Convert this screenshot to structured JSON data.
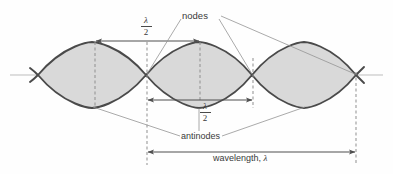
{
  "diagram": {
    "labels": {
      "nodes": "nodes",
      "antinodes": "antinodes",
      "wavelength": "wavelength,",
      "lambda_symbol": "λ",
      "half_wavelength_numerator": "λ",
      "half_wavelength_denominator": "2"
    },
    "colors": {
      "background": "#fefefe",
      "wave_stroke": "#4a4a4a",
      "wave_fill": "#d8d8d8",
      "axis": "#b9b9b9",
      "dashed": "#8a8a8a",
      "arrow": "#4f4f4f",
      "leader": "#8f8f8f",
      "text": "#3a3a3a"
    },
    "geometry": {
      "axis_y": 75,
      "amplitude": 33,
      "node_positions_x": [
        38,
        146,
        252,
        356
      ],
      "antinode_positions_x": [
        92,
        199,
        304
      ],
      "lobe_count": 3
    },
    "measurements": [
      {
        "name": "half-wavelength-top",
        "label": "λ/2",
        "from_x": 95,
        "to_x": 200,
        "y": 41,
        "spans": "antinode-1 to antinode-2"
      },
      {
        "name": "half-wavelength-middle",
        "label": "λ/2",
        "from_x": 147,
        "to_x": 253,
        "y": 100,
        "spans": "node-2 to node-3"
      },
      {
        "name": "full-wavelength",
        "label": "wavelength, λ",
        "from_x": 147,
        "to_x": 356,
        "y": 152,
        "spans": "node-2 to node-4"
      }
    ],
    "dashed_guides": [
      {
        "name": "antinode-1-guide",
        "x": 95,
        "y1": 42,
        "y2": 108
      },
      {
        "name": "node-2-guide",
        "x": 147,
        "y1": 42,
        "y2": 165
      },
      {
        "name": "antinode-2-guide",
        "x": 200,
        "y1": 42,
        "y2": 100
      },
      {
        "name": "node-3-guide",
        "x": 253,
        "y1": 60,
        "y2": 108
      },
      {
        "name": "node-4-guide",
        "x": 356,
        "y1": 72,
        "y2": 165
      }
    ],
    "leader_lines": {
      "nodes_targets": [
        "node-2",
        "node-3",
        "node-4"
      ],
      "antinodes_targets": [
        "antinode-1",
        "antinode-2",
        "antinode-3"
      ]
    }
  }
}
